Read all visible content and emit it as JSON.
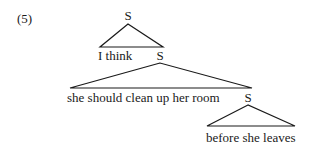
{
  "example_number": "(5)",
  "tree": {
    "root": {
      "label": "S",
      "children": [
        "I think",
        "S"
      ]
    },
    "level2": {
      "label": "S",
      "children": [
        "she should clean up her room",
        "S"
      ]
    },
    "level3": {
      "label": "S",
      "children": [
        "before she leaves"
      ]
    }
  },
  "text": {
    "node_s1": "S",
    "leaf1": "I think",
    "node_s2": "S",
    "leaf2": "she should clean up her room",
    "node_s3": "S",
    "leaf3": "before she leaves"
  },
  "colors": {
    "ink": "#1a1a1a",
    "background": "#ffffff"
  }
}
